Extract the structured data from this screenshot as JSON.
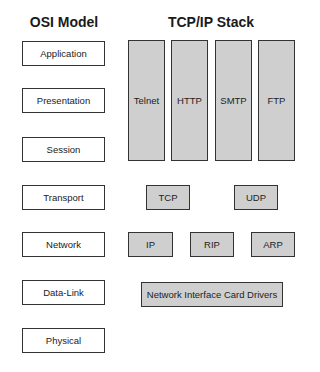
{
  "osi_title": "OSI Model",
  "tcpip_title": "TCP/IP Stack",
  "osi_layers": [
    "Application",
    "Presentation",
    "Session",
    "Transport",
    "Network",
    "Data-Link",
    "Physical"
  ],
  "application_protocols": [
    "Telnet",
    "HTTP",
    "SMTP",
    "FTP"
  ],
  "transport_protocols": [
    "TCP",
    "UDP"
  ],
  "network_protocols": [
    "IP",
    "RIP",
    "ARP"
  ],
  "datalink": "Network Interface Card Drivers",
  "colors": {
    "protocol_fill": "#cfcfcf",
    "border": "#333333",
    "layer_fill": "#ffffff"
  }
}
